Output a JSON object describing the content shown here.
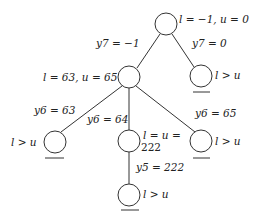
{
  "diagram": {
    "type": "search-tree",
    "nodes": [
      {
        "id": "root",
        "cx": 166,
        "cy": 24,
        "r": 11,
        "pruned": false,
        "label": "l = −1,  u = 0"
      },
      {
        "id": "n1",
        "cx": 129,
        "cy": 77,
        "r": 11,
        "pruned": false,
        "label": "l = 63,  u = 65"
      },
      {
        "id": "n2",
        "cx": 201,
        "cy": 76,
        "r": 11,
        "pruned": true,
        "label": "l > u"
      },
      {
        "id": "n3",
        "cx": 55,
        "cy": 142,
        "r": 11,
        "pruned": true,
        "label": "l > u"
      },
      {
        "id": "n4",
        "cx": 129,
        "cy": 141,
        "r": 11,
        "pruned": false,
        "label_line1": "l = u =",
        "label_line2": "222"
      },
      {
        "id": "n5",
        "cx": 201,
        "cy": 141,
        "r": 11,
        "pruned": true,
        "label": "l > u"
      },
      {
        "id": "n6",
        "cx": 129,
        "cy": 195,
        "r": 11,
        "pruned": true,
        "label": "l > u"
      }
    ],
    "edges": [
      {
        "from": "root",
        "to": "n1",
        "label": "y7 = −1"
      },
      {
        "from": "root",
        "to": "n2",
        "label": "y7 = 0"
      },
      {
        "from": "n1",
        "to": "n3",
        "label": "y6 = 63"
      },
      {
        "from": "n1",
        "to": "n4",
        "label": "y6 = 64"
      },
      {
        "from": "n1",
        "to": "n5",
        "label": "y6 = 65"
      },
      {
        "from": "n4",
        "to": "n6",
        "label": "y5 = 222"
      }
    ]
  }
}
